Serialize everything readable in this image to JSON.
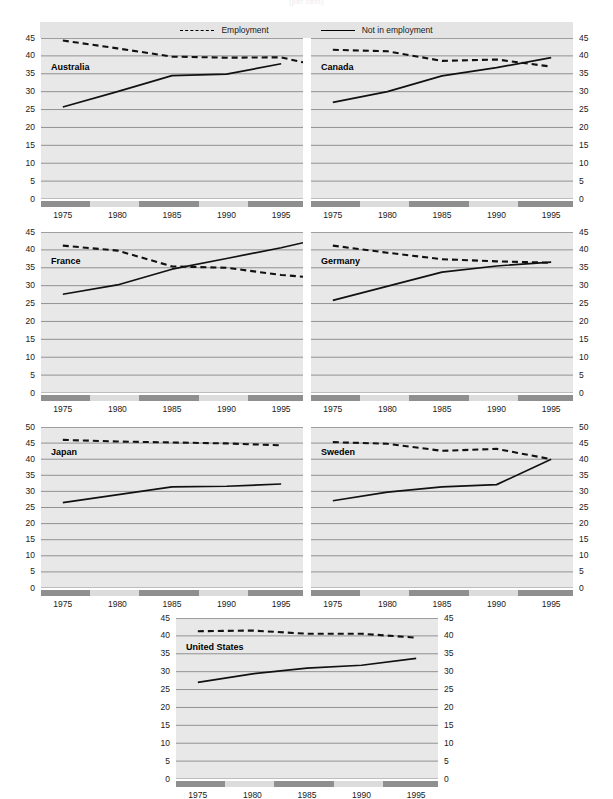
{
  "title_faint": "(per cent)",
  "legend": {
    "items": [
      {
        "label": "Employment",
        "style": "dashed",
        "icon": "dashed-line-icon"
      },
      {
        "label": "Not in employment",
        "style": "solid",
        "icon": "solid-line-icon"
      }
    ]
  },
  "axis": {
    "xticks": [
      "1975",
      "1980",
      "1985",
      "1990",
      "1995"
    ],
    "yticks_45": [
      "45",
      "40",
      "35",
      "30",
      "25",
      "20",
      "15",
      "10",
      "5",
      "0"
    ],
    "yticks_50": [
      "50",
      "45",
      "40",
      "35",
      "30",
      "25",
      "20",
      "15",
      "10",
      "5",
      "0"
    ]
  },
  "chart_data": {
    "type": "line",
    "title": "",
    "subtitle": "",
    "xlabel": "",
    "ylabel": "",
    "grid": true,
    "legend_position": "top",
    "x": [
      1973,
      1975,
      1980,
      1985,
      1990,
      1995,
      1997
    ],
    "xlim": [
      1973,
      1997
    ],
    "panels": [
      {
        "name": "Australia",
        "ylim": [
          0,
          45
        ],
        "yticks": [
          0,
          5,
          10,
          15,
          20,
          25,
          30,
          35,
          40,
          45
        ],
        "series": [
          {
            "name": "Employment",
            "style": "dashed",
            "x": [
              1975,
              1980,
              1985,
              1990,
              1995,
              1997
            ],
            "values": [
              44.3,
              42.1,
              39.8,
              39.5,
              39.6,
              38.2
            ]
          },
          {
            "name": "Not in employment",
            "style": "solid",
            "x": [
              1975,
              1980,
              1985,
              1990,
              1995
            ],
            "values": [
              25.7,
              30.0,
              34.5,
              34.9,
              37.8
            ]
          }
        ]
      },
      {
        "name": "Canada",
        "ylim": [
          0,
          45
        ],
        "yticks": [
          0,
          5,
          10,
          15,
          20,
          25,
          30,
          35,
          40,
          45
        ],
        "series": [
          {
            "name": "Employment",
            "style": "dashed",
            "x": [
              1975,
              1980,
              1985,
              1990,
              1995
            ],
            "values": [
              41.7,
              41.3,
              38.6,
              39.0,
              37.0
            ]
          },
          {
            "name": "Not in employment",
            "style": "solid",
            "x": [
              1975,
              1980,
              1985,
              1990,
              1995
            ],
            "values": [
              27.0,
              30.0,
              34.4,
              36.7,
              39.5
            ]
          }
        ]
      },
      {
        "name": "France",
        "ylim": [
          0,
          45
        ],
        "yticks": [
          0,
          5,
          10,
          15,
          20,
          25,
          30,
          35,
          40,
          45
        ],
        "series": [
          {
            "name": "Employment",
            "style": "dashed",
            "x": [
              1975,
              1980,
              1985,
              1990,
              1995,
              1997
            ],
            "values": [
              41.2,
              39.8,
              35.4,
              35.0,
              33.0,
              32.5
            ]
          },
          {
            "name": "Not in employment",
            "style": "solid",
            "x": [
              1975,
              1980,
              1985,
              1990,
              1995,
              1997
            ],
            "values": [
              27.6,
              30.2,
              34.6,
              37.6,
              40.6,
              42.0
            ]
          }
        ]
      },
      {
        "name": "Germany",
        "ylim": [
          0,
          45
        ],
        "yticks": [
          0,
          5,
          10,
          15,
          20,
          25,
          30,
          35,
          40,
          45
        ],
        "series": [
          {
            "name": "Employment",
            "style": "dashed",
            "x": [
              1975,
              1980,
              1985,
              1990,
              1995
            ],
            "values": [
              41.2,
              39.2,
              37.4,
              36.8,
              36.4
            ]
          },
          {
            "name": "Not in employment",
            "style": "solid",
            "x": [
              1975,
              1985,
              1990,
              1995
            ],
            "values": [
              25.9,
              33.8,
              35.5,
              36.6
            ]
          }
        ]
      },
      {
        "name": "Japan",
        "ylim": [
          0,
          50
        ],
        "yticks": [
          0,
          5,
          10,
          15,
          20,
          25,
          30,
          35,
          40,
          45,
          50
        ],
        "series": [
          {
            "name": "Employment",
            "style": "dashed",
            "x": [
              1975,
              1980,
              1985,
              1990,
              1995
            ],
            "values": [
              46.0,
              45.5,
              45.2,
              44.9,
              44.3
            ]
          },
          {
            "name": "Not in employment",
            "style": "solid",
            "x": [
              1975,
              1985,
              1990,
              1995
            ],
            "values": [
              26.5,
              31.4,
              31.6,
              32.3
            ]
          }
        ]
      },
      {
        "name": "Sweden",
        "ylim": [
          0,
          50
        ],
        "yticks": [
          0,
          5,
          10,
          15,
          20,
          25,
          30,
          35,
          40,
          45,
          50
        ],
        "series": [
          {
            "name": "Employment",
            "style": "dashed",
            "x": [
              1975,
              1980,
              1985,
              1990,
              1995
            ],
            "values": [
              45.3,
              44.8,
              42.6,
              43.2,
              40.0
            ]
          },
          {
            "name": "Not in employment",
            "style": "solid",
            "x": [
              1975,
              1980,
              1985,
              1990,
              1995
            ],
            "values": [
              27.1,
              29.8,
              31.4,
              32.1,
              40.0
            ]
          }
        ]
      },
      {
        "name": "United States",
        "ylim": [
          0,
          45
        ],
        "yticks": [
          0,
          5,
          10,
          15,
          20,
          25,
          30,
          35,
          40,
          45
        ],
        "series": [
          {
            "name": "Employment",
            "style": "dashed",
            "x": [
              1975,
              1980,
              1985,
              1990,
              1995
            ],
            "values": [
              41.3,
              41.5,
              40.6,
              40.6,
              39.5
            ]
          },
          {
            "name": "Not in employment",
            "style": "solid",
            "x": [
              1975,
              1980,
              1985,
              1990,
              1995
            ],
            "values": [
              27.0,
              29.4,
              31.0,
              31.8,
              33.7
            ]
          }
        ]
      }
    ]
  }
}
